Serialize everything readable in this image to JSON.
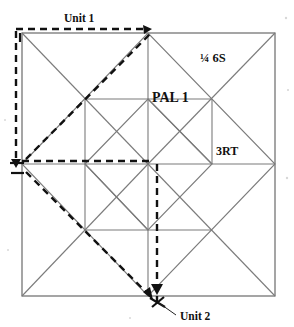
{
  "figure": {
    "title_caption": "",
    "labels": {
      "unit1": "Unit 1",
      "unit2": "Unit 2",
      "quarter_six_s": "¼ 6S",
      "pal1": "PAL 1",
      "three_rt": "3RT"
    },
    "colors": {
      "solid_stroke": "#7b7b7b",
      "dashed_stroke": "#111111",
      "text": "#111111",
      "background": "#ffffff"
    },
    "geometry": {
      "outer_square": {
        "x0": 22,
        "y0": 33,
        "x1": 275,
        "y1": 296
      },
      "grid_x": [
        22,
        85,
        148,
        212,
        275
      ],
      "grid_y": [
        33,
        99,
        164,
        230,
        296
      ],
      "dashed_overlays": [
        {
          "name": "unit1-top",
          "from": [
            16,
            29
          ],
          "to": [
            152,
            29
          ],
          "kind": "horizontal"
        },
        {
          "name": "unit1-left",
          "from": [
            16,
            29
          ],
          "to": [
            16,
            168
          ],
          "kind": "vertical"
        },
        {
          "name": "unit1-diagonal",
          "from": [
            25,
            163
          ],
          "to": [
            152,
            33
          ],
          "kind": "diagonal"
        },
        {
          "name": "unit1-bottom",
          "from": [
            22,
            161
          ],
          "to": [
            152,
            161
          ],
          "kind": "horizontal"
        },
        {
          "name": "unit2-vertical",
          "from": [
            157,
            164
          ],
          "to": [
            157,
            305
          ],
          "kind": "vertical"
        },
        {
          "name": "unit2-diagonal",
          "from": [
            25,
            171
          ],
          "to": [
            156,
            300
          ],
          "kind": "diagonal"
        }
      ],
      "arrow_heads": [
        {
          "name": "unit1-top-arrow",
          "at": [
            150,
            31
          ],
          "direction": "right"
        },
        {
          "name": "unit1-left-arrow",
          "at": [
            16,
            166
          ],
          "direction": "down"
        },
        {
          "name": "unit2-vertical-arrow",
          "at": [
            157,
            293
          ],
          "direction": "down"
        },
        {
          "name": "unit2-diagonal-arrow",
          "at": [
            154,
            298
          ],
          "direction": "down-right"
        }
      ]
    }
  }
}
